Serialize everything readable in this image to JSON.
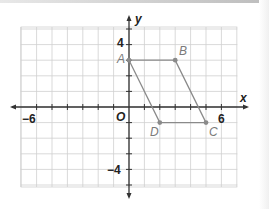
{
  "diagram": {
    "type": "coordinate_plane",
    "axes": {
      "x_label": "x",
      "y_label": "y",
      "origin_label": "O",
      "x_range": [
        -7,
        7
      ],
      "y_range": [
        -5,
        5
      ],
      "tick_labels": {
        "x_neg": "−6",
        "x_pos": "6",
        "y_pos": "4",
        "y_neg": "−4"
      }
    },
    "shape": "parallelogram",
    "points": [
      {
        "label": "A",
        "x": 0,
        "y": 3
      },
      {
        "label": "B",
        "x": 3,
        "y": 3
      },
      {
        "label": "C",
        "x": 5,
        "y": -1
      },
      {
        "label": "D",
        "x": 2,
        "y": -1
      }
    ],
    "colors": {
      "grid": "#cfcfcf",
      "axis": "#333333",
      "shape": "#8a8a8a",
      "point_label": "#7a7a7a"
    }
  }
}
